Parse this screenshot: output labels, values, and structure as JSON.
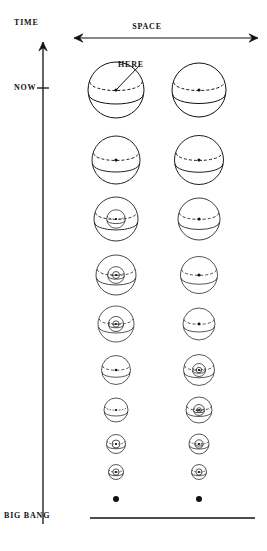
{
  "figure": {
    "kind": "spacetime-expansion-diagram",
    "background": "#ffffff",
    "ink": "#111111"
  },
  "axes": {
    "time": {
      "label": "TIME",
      "direction": "up",
      "arrow": "single-headed",
      "x": 43,
      "top_y": 42,
      "bottom_y": 524,
      "tick": {
        "label": "NOW",
        "y": 88,
        "half_width": 6
      }
    },
    "space": {
      "label": "SPACE",
      "direction": "horizontal",
      "arrow": "double-headed",
      "y": 38,
      "x_start": 74,
      "x_end": 258
    },
    "baseline": {
      "label": "BIG BANG",
      "y": 518,
      "x_start": 90,
      "x_end": 255
    }
  },
  "annotation": {
    "here": {
      "label": "HERE",
      "text_x": 118,
      "text_y": 60,
      "leader_from_x": 139,
      "leader_from_y": 66,
      "leader_to_x": 116,
      "leader_to_y": 90
    }
  },
  "columns": [
    {
      "name": "left-column",
      "cx": 116
    },
    {
      "name": "right-column",
      "cx": 199
    }
  ],
  "rows": [
    {
      "index": 0,
      "cy": 90,
      "left_r": 28.0,
      "right_r": 27.0,
      "left_depth": 0,
      "right_depth": 0
    },
    {
      "index": 1,
      "cy": 160,
      "left_r": 24.0,
      "right_r": 24.5,
      "left_depth": 0,
      "right_depth": 0
    },
    {
      "index": 2,
      "cy": 219,
      "left_r": 22.0,
      "right_r": 21.0,
      "left_depth": 1,
      "right_depth": 0
    },
    {
      "index": 3,
      "cy": 275,
      "left_r": 20.0,
      "right_r": 18.5,
      "left_depth": 2,
      "right_depth": 0
    },
    {
      "index": 4,
      "cy": 324,
      "left_r": 18.0,
      "right_r": 16.0,
      "left_depth": 3,
      "right_depth": 0
    },
    {
      "index": 5,
      "cy": 370,
      "left_r": 14.5,
      "right_r": 15.5,
      "left_depth": 0,
      "right_depth": 3
    },
    {
      "index": 6,
      "cy": 410,
      "left_r": 12.0,
      "right_r": 13.0,
      "left_depth": 0,
      "right_depth": 3
    },
    {
      "index": 7,
      "cy": 444,
      "left_r": 9.5,
      "right_r": 10.0,
      "left_depth": 1,
      "right_depth": 2
    },
    {
      "index": 8,
      "cy": 472,
      "left_r": 7.5,
      "right_r": 7.5,
      "left_depth": 1,
      "right_depth": 1
    },
    {
      "index": 9,
      "cy": 499,
      "left_r": 0,
      "right_r": 0,
      "left_depth": 0,
      "right_depth": 0,
      "dot_only": true,
      "dot_r": 3.0
    }
  ],
  "sphere_style": {
    "stroke": "#111111",
    "stroke_width": 1.0,
    "fill": "none",
    "equator_arc": "solid lower arc",
    "latitude_arc": "dashed upper ellipse",
    "center_dot": true,
    "center_dot_r": 1.6,
    "dash_pattern": "3,2"
  }
}
